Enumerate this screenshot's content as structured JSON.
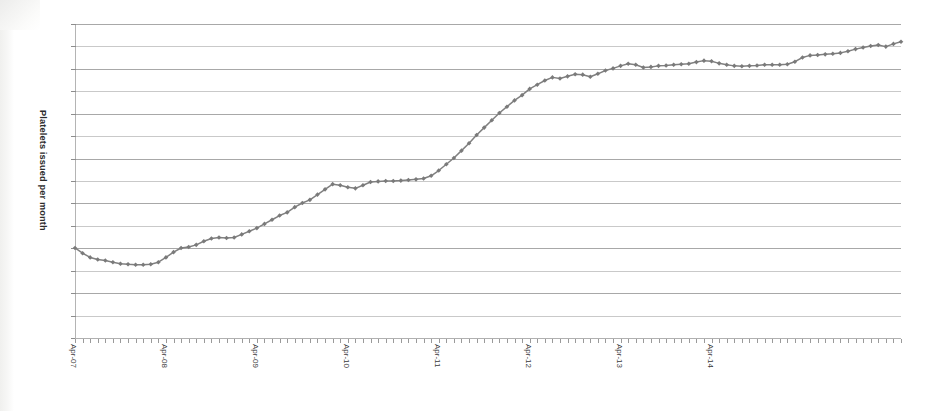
{
  "figure": {
    "background_color": "#ffffff",
    "plot_area": {
      "left": 75,
      "top": 24,
      "width": 826,
      "height": 314
    }
  },
  "axis_titles": {
    "y": "Platelets issued per month",
    "x": ""
  },
  "style": {
    "series_color": "#808080",
    "marker_color": "#7a7a7a",
    "gridline_color": "#a8a8a8",
    "axis_color": "#b4b4b4",
    "label_color": "#3a3a3a"
  },
  "chart_data": {
    "type": "line",
    "title": "",
    "subtitle": "",
    "xlabel": "",
    "ylabel": "Platelets issued per month",
    "grid": true,
    "legend": null,
    "legend_position": "none",
    "y_tick_labels": [],
    "ylim": [
      0,
      15
    ],
    "y_gridline_count": 15,
    "x_tick_labels": [
      "Apr-07",
      "Apr-08",
      "Apr-09",
      "Apr-10",
      "Apr-11",
      "Apr-12",
      "Apr-13",
      "Apr-14"
    ],
    "x_tick_label_rotation": 90,
    "x_tick_label_interval_months": 12,
    "x_series_start": "Apr-07",
    "x_series_interval": "monthly",
    "marker": "diamond",
    "series": [
      {
        "name": "Platelets issued per month",
        "color": "#7a7a7a",
        "values": [
          4.3,
          4.05,
          3.85,
          3.75,
          3.7,
          3.62,
          3.55,
          3.52,
          3.5,
          3.5,
          3.52,
          3.62,
          3.85,
          4.1,
          4.3,
          4.35,
          4.45,
          4.62,
          4.75,
          4.8,
          4.78,
          4.8,
          4.95,
          5.1,
          5.25,
          5.45,
          5.65,
          5.85,
          6.0,
          6.25,
          6.45,
          6.6,
          6.85,
          7.1,
          7.35,
          7.3,
          7.2,
          7.15,
          7.3,
          7.45,
          7.48,
          7.5,
          7.5,
          7.52,
          7.55,
          7.58,
          7.62,
          7.75,
          8.0,
          8.3,
          8.6,
          8.95,
          9.3,
          9.7,
          10.05,
          10.4,
          10.75,
          11.05,
          11.35,
          11.6,
          11.9,
          12.1,
          12.3,
          12.45,
          12.4,
          12.5,
          12.6,
          12.58,
          12.48,
          12.62,
          12.78,
          12.88,
          13.0,
          13.1,
          13.05,
          12.92,
          12.95,
          13.0,
          13.02,
          13.05,
          13.08,
          13.1,
          13.18,
          13.25,
          13.22,
          13.12,
          13.05,
          13.0,
          12.98,
          13.0,
          13.02,
          13.05,
          13.05,
          13.05,
          13.08,
          13.2,
          13.4,
          13.5,
          13.52,
          13.55,
          13.58,
          13.62,
          13.7,
          13.8,
          13.88,
          13.95,
          14.0,
          13.92,
          14.05,
          14.15
        ]
      }
    ]
  }
}
